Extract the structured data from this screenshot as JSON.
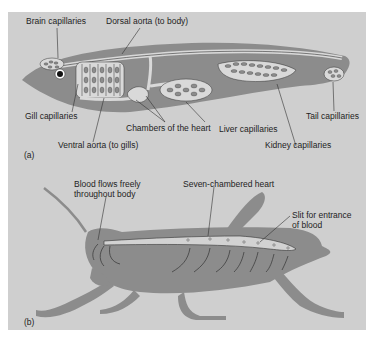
{
  "figure": {
    "background": "#cfcfcf",
    "body_color": "#8c8c8c",
    "vessel_color": "#d9d9d9"
  },
  "panel_a": {
    "tag": "(a)",
    "subject": "fish closed circulatory system",
    "labels": {
      "brain_capillaries": "Brain capillaries",
      "dorsal_aorta": "Dorsal aorta (to body)",
      "gill_capillaries": "Gill capillaries",
      "ventral_aorta": "Ventral aorta (to gills)",
      "chambers_heart": "Chambers of the heart",
      "liver_capillaries": "Liver capillaries",
      "kidney_capillaries": "Kidney capillaries",
      "tail_capillaries": "Tail capillaries"
    }
  },
  "panel_b": {
    "tag": "(b)",
    "subject": "grasshopper open circulatory system",
    "labels": {
      "blood_flows_line1": "Blood flows freely",
      "blood_flows_line2": "throughout body",
      "seven_chambered": "Seven-chambered heart",
      "slit_line1": "Slit for entrance",
      "slit_line2": "of blood"
    }
  }
}
